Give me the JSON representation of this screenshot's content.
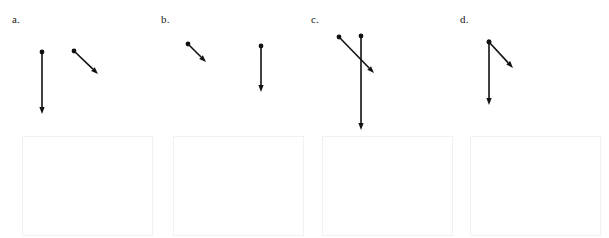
{
  "page": {
    "background_color": "#ffffff",
    "width": 609,
    "height": 238
  },
  "style": {
    "arrow_color": "#111111",
    "arrow_stroke_width": 1.6,
    "dot_radius": 2.4,
    "box_border_color": "#f1f1f1",
    "label_color": "#1a1a1a"
  },
  "panels": [
    {
      "id": "a",
      "label": "a.",
      "label_x": 12,
      "label_y": 14,
      "panel_left": 0,
      "vectors": [
        {
          "name": "vector-1",
          "x1": 42,
          "y1": 52,
          "x2": 42,
          "y2": 114,
          "has_tail_dot": true,
          "has_head_arrow": true
        },
        {
          "name": "vector-2",
          "x1": 74,
          "y1": 51,
          "x2": 98,
          "y2": 74,
          "has_tail_dot": true,
          "has_head_arrow": true
        }
      ],
      "answer_box": {
        "x": 22,
        "y": 136,
        "width": 131,
        "height": 100
      }
    },
    {
      "id": "b",
      "label": "b.",
      "label_x": 161,
      "label_y": 14,
      "panel_left": 152,
      "vectors": [
        {
          "name": "vector-1",
          "x1": 188,
          "y1": 44,
          "x2": 206,
          "y2": 62,
          "has_tail_dot": true,
          "has_head_arrow": true
        },
        {
          "name": "vector-2",
          "x1": 261,
          "y1": 46,
          "x2": 261,
          "y2": 92,
          "has_tail_dot": true,
          "has_head_arrow": true
        }
      ],
      "answer_box": {
        "x": 173,
        "y": 136,
        "width": 131,
        "height": 100
      }
    },
    {
      "id": "c",
      "label": "c.",
      "label_x": 311,
      "label_y": 14,
      "panel_left": 304,
      "vectors": [
        {
          "name": "vector-1",
          "x1": 339,
          "y1": 37,
          "x2": 374,
          "y2": 73,
          "has_tail_dot": true,
          "has_head_arrow": true
        },
        {
          "name": "vector-2",
          "x1": 361,
          "y1": 36,
          "x2": 361,
          "y2": 130,
          "has_tail_dot": true,
          "has_head_arrow": true
        }
      ],
      "answer_box": {
        "x": 322,
        "y": 136,
        "width": 131,
        "height": 100
      }
    },
    {
      "id": "d",
      "label": "d.",
      "label_x": 460,
      "label_y": 14,
      "panel_left": 456,
      "vectors": [
        {
          "name": "vector-1",
          "x1": 489,
          "y1": 42,
          "x2": 489,
          "y2": 105,
          "has_tail_dot": true,
          "has_head_arrow": true
        },
        {
          "name": "vector-2",
          "x1": 489,
          "y1": 42,
          "x2": 513,
          "y2": 68,
          "has_tail_dot": true,
          "has_head_arrow": true
        }
      ],
      "answer_box": {
        "x": 470,
        "y": 136,
        "width": 131,
        "height": 100
      }
    }
  ]
}
